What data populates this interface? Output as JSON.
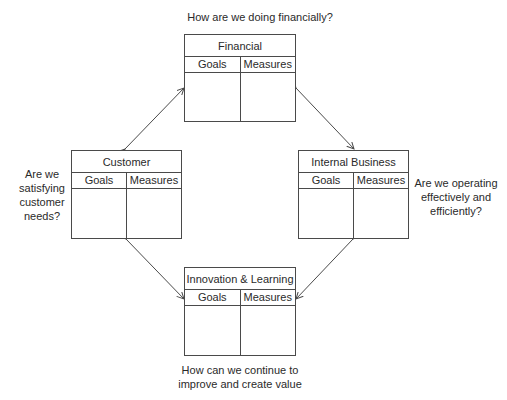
{
  "diagram": {
    "type": "balanced-scorecard",
    "perspectives": [
      {
        "id": "financial",
        "title": "Financial",
        "columns": [
          "Goals",
          "Measures"
        ],
        "question": "How are we doing financially?"
      },
      {
        "id": "customer",
        "title": "Customer",
        "columns": [
          "Goals",
          "Measures"
        ],
        "question_lines": [
          "Are we",
          "satisfying",
          "customer",
          "needs?"
        ]
      },
      {
        "id": "internal_business",
        "title": "Internal Business",
        "columns": [
          "Goals",
          "Measures"
        ],
        "question_lines": [
          "Are we operating",
          "effectively and",
          "efficiently?"
        ]
      },
      {
        "id": "innovation_learning",
        "title": "Innovation & Learning",
        "columns": [
          "Goals",
          "Measures"
        ],
        "question_lines": [
          "How can we continue to",
          "improve and create value"
        ]
      }
    ],
    "connections": [
      {
        "from": "financial",
        "to": "customer",
        "bidirectional": true
      },
      {
        "from": "financial",
        "to": "internal_business",
        "bidirectional": true
      },
      {
        "from": "customer",
        "to": "innovation_learning",
        "bidirectional": true
      },
      {
        "from": "internal_business",
        "to": "innovation_learning",
        "bidirectional": true
      }
    ],
    "colors": {
      "line": "#4a4a4a",
      "text": "#2a2a2a",
      "background": "#ffffff"
    }
  }
}
